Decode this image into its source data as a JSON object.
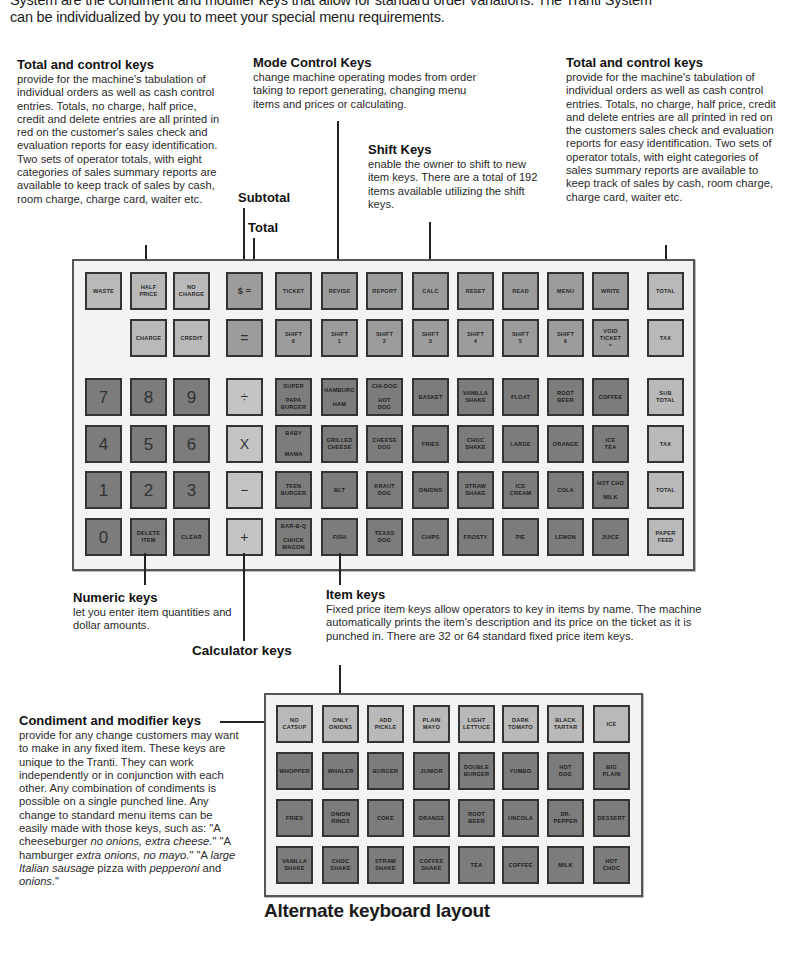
{
  "intro": {
    "line1": "System are the condiment and modifier keys that allow for standard order variations. The Tranti System",
    "line2": "can be individualized by you to meet your special menu requirements."
  },
  "annotations": {
    "total_control_left": {
      "title": "Total and control keys",
      "body": "provide for the machine's tabulation of individual orders as well as cash control entries. Totals, no charge, half price, credit and delete entries are all printed in red on the customer's sales check and evaluation reports for easy identification. Two sets of operator totals, with eight categories of sales summary reports are available to keep track of sales by cash, room charge, charge card, waiter etc."
    },
    "mode_control": {
      "title": "Mode Control Keys",
      "body": "change machine operating modes from order taking to report generating, changing menu items and prices or calculating."
    },
    "shift": {
      "title": "Shift Keys",
      "body": "enable the owner to shift to new item keys. There are a total of 192 items available utilizing the shift keys."
    },
    "total_control_right": {
      "title": "Total and control keys",
      "body": "provide for the machine's tabulation of individual orders as well as cash control entries. Totals, no charge, half price, credit and delete entries are all printed in red on the customers sales check and evaluation reports for easy identification. Two sets of operator totals, with eight categories of sales summary reports are available to keep track of sales by cash, room charge, charge card, waiter etc."
    },
    "subtotal_label": "Subtotal",
    "total_label": "Total",
    "numeric": {
      "title": "Numeric keys",
      "body": "let you enter item quantities and dollar amounts."
    },
    "calculator_label": "Calculator keys",
    "item": {
      "title": "Item keys",
      "body": "Fixed price item keys allow operators to key in items by name. The machine automatically prints the item's description and its price on the ticket as it is punched in. There are 32 or 64 standard fixed price item keys."
    },
    "condiment": {
      "title": "Condiment and modifier keys",
      "body_parts": {
        "p1": "provide for any change customers may want to make in any fixed item. These keys are unique to the Tranti. They can work independently or in conjunction with each other. Any combination of condiments is possible on a single punched line. Any change to standard menu items can be easily made with those keys, such as: \"A cheeseburger ",
        "i1": "no onions, extra cheese.",
        "p2": "\" \"A hamburger ",
        "i2": "extra onions, no mayo.",
        "p3": "\" \"A ",
        "i3": "large Italian sausage",
        "p4": " pizza with ",
        "i4": "pepperoni",
        "p5": " and ",
        "i5": "onions.",
        "p6": "\""
      }
    }
  },
  "main_keyboard": {
    "row1": [
      "WASTE",
      "HALF\nPRICE",
      "NO\nCHARGE",
      "$ =",
      "TICKET",
      "REVISE",
      "REPORT",
      "CALC",
      "RESET",
      "READ",
      "MENU",
      "WRITE",
      "TOTAL"
    ],
    "row2": [
      "CHARGE",
      "CREDIT",
      "=",
      "SHIFT\n0",
      "SHIFT\n1",
      "SHIFT\n2",
      "SHIFT\n3",
      "SHIFT\n4",
      "SHIFT\n5",
      "SHIFT\n6",
      "VOID\nTICKET\n=",
      "TAX"
    ],
    "numeric": [
      "7",
      "8",
      "9",
      "4",
      "5",
      "6",
      "1",
      "2",
      "3",
      "0",
      "DELETE\nITEM",
      "CLEAR"
    ],
    "calculator": [
      "÷",
      "X",
      "−",
      "+"
    ],
    "items": [
      [
        "SUPER\n\nPAPA\nBURGER",
        "HAMBURG\n\nHAM",
        "CHI-DOG\n\nHOT\nDOG",
        "BASKET",
        "VANILLA\nSHAKE",
        "FLOAT",
        "ROOT\nBEER",
        "COFFEE"
      ],
      [
        "BABY\n\n\nMAMA",
        "GRILLED\nCHEESE",
        "CHEESE\nDOG",
        "FRIES",
        "CHOC\nSHAKE",
        "LARGE",
        "ORANGE",
        "ICE\nTEA"
      ],
      [
        "TEEN\nBURGER",
        "BLT",
        "KRAUT\nDOG",
        "ONIONS",
        "STRAW\nSHAKE",
        "ICE\nCREAM",
        "COLA",
        "HOT CHO\n\nMILK"
      ],
      [
        "BAR-B-Q\n\nCHUCK\nWAGON",
        "FISH",
        "TEXAS\nDOG",
        "CHIPS",
        "FROSTY",
        "PIE",
        "LEMON",
        "JUICE"
      ]
    ],
    "right_column": [
      "SUB\nTOTAL",
      "TAX",
      "TOTAL",
      "PAPER\nFEED"
    ]
  },
  "alternate_keyboard": {
    "title": "Alternate keyboard layout",
    "rows": [
      [
        "NO\nCATSUP",
        "ONLY\nONIONS",
        "ADD\nPICKLE",
        "PLAIN\nMAYO",
        "LIGHT\nLETTUCE",
        "DARK\nTOMATO",
        "BLACK\nTARTAR",
        "ICE"
      ],
      [
        "WHOPPER",
        "WHALER",
        "BURGER",
        "JUNIOR",
        "DOUBLE\nBURGER",
        "YUMBO",
        "HOT\nDOG",
        "BIG\nPLAIN"
      ],
      [
        "FRIES",
        "ONION\nRINGS",
        "COKE",
        "ORANGE",
        "ROOT\nBEER",
        "UNCOLA",
        "DR.\nPEPPER",
        "DESSERT"
      ],
      [
        "VANILLA\nSHAKE",
        "CHOC\nSHAKE",
        "STRAW\nSHAKE",
        "COFFEE\nSHAKE",
        "TEA",
        "COFFEE",
        "MILK",
        "HOT\nCHOC"
      ]
    ]
  }
}
